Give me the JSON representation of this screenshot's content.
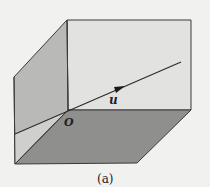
{
  "figure": {
    "caption": "(a)",
    "origin_label": "O",
    "vector_label": "u"
  },
  "colors": {
    "background": "#f1f1f0",
    "back_wall": "#e2e2e1",
    "left_wall": "#b9b9b8",
    "left_wall_lower": "#cfcfce",
    "floor": "#8f8f8e",
    "edge": "#3a3a3a"
  }
}
